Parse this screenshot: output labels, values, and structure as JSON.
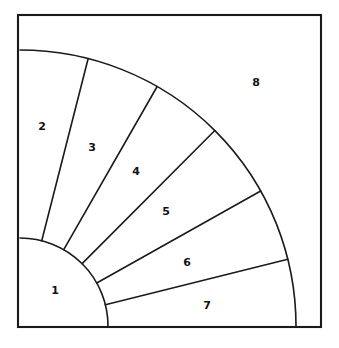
{
  "figure": {
    "title": "",
    "background_color": "#ffffff",
    "stroke_color": "#1a1a1a",
    "fill_color": "#ffffff",
    "border": {
      "name": "outer-frame",
      "x": 18,
      "y": 15,
      "width": 303,
      "height": 312,
      "stroke_width": 2.1
    },
    "geometry": {
      "center_x": 20,
      "center_y": 326,
      "inner_radius": 88,
      "outer_radius": 276,
      "divider_angles_deg": [
        75.7,
        60.2,
        45.1,
        29.3,
        14.0
      ],
      "stroke_width": 1.6
    },
    "regions": [
      {
        "id": "region-1",
        "label": "1",
        "label_x": 55,
        "label_y": 290
      },
      {
        "id": "region-2",
        "label": "2",
        "label_x": 42,
        "label_y": 126
      },
      {
        "id": "region-3",
        "label": "3",
        "label_x": 92,
        "label_y": 147
      },
      {
        "id": "region-4",
        "label": "4",
        "label_x": 136,
        "label_y": 171
      },
      {
        "id": "region-5",
        "label": "5",
        "label_x": 166,
        "label_y": 211
      },
      {
        "id": "region-6",
        "label": "6",
        "label_x": 187,
        "label_y": 262
      },
      {
        "id": "region-7",
        "label": "7",
        "label_x": 207,
        "label_y": 305
      },
      {
        "id": "region-8",
        "label": "8",
        "label_x": 256,
        "label_y": 82
      }
    ]
  }
}
